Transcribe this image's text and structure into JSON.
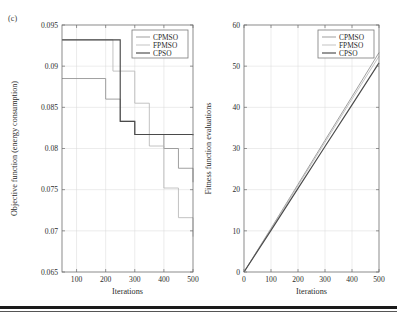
{
  "figure": {
    "panel_label": "(c)",
    "colors": {
      "cpmso": "#8f8f8f",
      "fpmso": "#b8b8b8",
      "cpso": "#4a4a4a",
      "axis": "#6e6e6e",
      "grid": "#d9d9d9",
      "text": "#2b2b2b",
      "rule": "#1a1a1a"
    }
  },
  "chart_data": [
    {
      "type": "line",
      "id": "left",
      "title": "",
      "xlabel": "Iterations",
      "ylabel": "Objective function (energy consumption)",
      "xlim": [
        50,
        500
      ],
      "ylim": [
        0.065,
        0.095
      ],
      "xticks": [
        100,
        200,
        300,
        400,
        500
      ],
      "yticks": [
        0.065,
        0.07,
        0.075,
        0.08,
        0.085,
        0.09,
        0.095
      ],
      "xtick_labels": [
        "100",
        "200",
        "300",
        "400",
        "500"
      ],
      "ytick_labels": [
        "0.065",
        "0.07",
        "0.075",
        "0.08",
        "0.085",
        "0.09",
        "0.095"
      ],
      "grid": true,
      "legend_position": "top-right",
      "drawstyle": "steps-post",
      "series": [
        {
          "name": "CPMSO",
          "color": "#8f8f8f",
          "x": [
            50,
            200,
            250,
            300,
            350,
            400,
            450,
            500
          ],
          "values": [
            0.0885,
            0.086,
            0.0833,
            0.0817,
            0.0817,
            0.08,
            0.0776,
            0.0759
          ]
        },
        {
          "name": "FPMSO",
          "color": "#b8b8b8",
          "x": [
            50,
            200,
            225,
            250,
            300,
            350,
            400,
            450,
            500
          ],
          "values": [
            0.0932,
            0.0932,
            0.0894,
            0.0894,
            0.0855,
            0.0803,
            0.0752,
            0.0716,
            0.0693
          ]
        },
        {
          "name": "CPSO",
          "color": "#4a4a4a",
          "x": [
            50,
            200,
            250,
            300,
            500
          ],
          "values": [
            0.0932,
            0.0932,
            0.0833,
            0.0817,
            0.0816
          ]
        }
      ]
    },
    {
      "type": "line",
      "id": "right",
      "title": "",
      "xlabel": "Iterations",
      "ylabel": "Fitness function evaluations",
      "xlim": [
        0,
        500
      ],
      "ylim": [
        0,
        60
      ],
      "xticks": [
        0,
        100,
        200,
        300,
        400,
        500
      ],
      "yticks": [
        0,
        10,
        20,
        30,
        40,
        50,
        60
      ],
      "xtick_labels": [
        "0",
        "100",
        "200",
        "300",
        "400",
        "500"
      ],
      "ytick_labels": [
        "0",
        "10",
        "20",
        "30",
        "40",
        "50",
        "60"
      ],
      "grid": true,
      "legend_position": "top-right",
      "drawstyle": "line",
      "series": [
        {
          "name": "CPMSO",
          "color": "#8f8f8f",
          "x": [
            0,
            100,
            200,
            300,
            400,
            500
          ],
          "values": [
            0,
            10.6,
            21.3,
            32.0,
            42.6,
            53.3
          ]
        },
        {
          "name": "FPMSO",
          "color": "#b8b8b8",
          "x": [
            0,
            100,
            200,
            300,
            400,
            500
          ],
          "values": [
            0,
            10.4,
            21.0,
            31.5,
            42.0,
            52.4
          ]
        },
        {
          "name": "CPSO",
          "color": "#4a4a4a",
          "x": [
            0,
            100,
            200,
            300,
            400,
            500
          ],
          "values": [
            0,
            10.1,
            20.3,
            30.5,
            40.6,
            50.8
          ]
        }
      ]
    }
  ]
}
